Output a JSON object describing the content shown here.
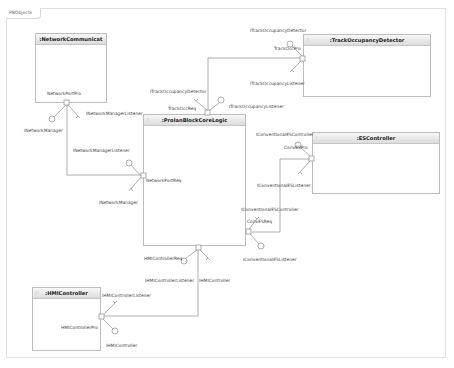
{
  "frame": {
    "label": "PBObjects"
  },
  "components": {
    "network": {
      "title": ":NetworkCommunicat",
      "icon": "component-icon"
    },
    "track": {
      "title": ":TrackOccupancyDetector",
      "icon": "component-icon"
    },
    "core": {
      "title": ":ProlanBlockCoreLogic",
      "icon": "component-icon"
    },
    "es": {
      "title": ":ESController",
      "icon": "component-icon"
    },
    "hmi": {
      "title": ":HMIController",
      "icon": "component-icon"
    }
  },
  "labels": {
    "network_port_pro": "NetworkPortPro",
    "inetwork_manager_1": "INetworkManager",
    "inetwork_manager_listener_1": "INetworkManagerListener",
    "inetwork_manager_listener_2": "INetworkManagerListener",
    "network_port_req": "NetworkPortReq",
    "inetwork_manager_2": "INetworkManager",
    "itrack_occ_detector_1": "ITrackOccupancyDetector",
    "track_occ_pro": "TrackOccPro",
    "itrack_occ_listener_1": "ITrackOccupancyListener",
    "itrack_occ_detector_2": "ITrackOccupancyDetector",
    "track_occ_req": "TrackOccReq",
    "itrack_occ_listener_2": "ITrackOccupancyListener",
    "iconv_es_controller_1": "IConventionalESController",
    "conv_es_pro": "ConvESPro",
    "iconv_es_listener_1": "IConventionalESListener",
    "iconv_es_controller_2": "IConventionalESController",
    "conv_es_req": "ConvESReq",
    "iconv_es_listener_2": "IConventionalESListener",
    "hmi_controller_req": "HMIControllerReq",
    "ihmi_controller_listener_1": "IHMIControllerListener",
    "ihmi_controller_1": "IHMIController",
    "ihmi_controller_listener_2": "IHMIControllerListener",
    "hmi_controller_pro": "HMIControllerPro",
    "ihmi_controller_2": "IHMIController"
  },
  "colors": {
    "border": "#bdbdbd",
    "header_top": "#f7f7f7",
    "header_bottom": "#dcdcdc",
    "wire": "#9a9a9a"
  }
}
